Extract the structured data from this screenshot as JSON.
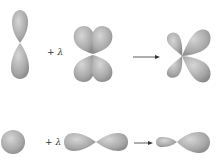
{
  "diagram": {
    "rows": [
      {
        "name": "p-d-hybridization",
        "left_orbital": "p orbital (vertical)",
        "operator_label": "+ λ",
        "right_orbital": "d orbital (cloverleaf)",
        "result": "p-d hybrid orbital"
      },
      {
        "name": "s-p-hybridization",
        "left_orbital": "s orbital (sphere)",
        "operator_label": "+ λ",
        "right_orbital": "p orbital (horizontal)",
        "result": "s-p hybrid orbital"
      }
    ],
    "colors": {
      "lobe_light": "#d0d0d0",
      "lobe_dark": "#8c8c8c",
      "arrow": "#333333",
      "background": "#ffffff"
    }
  }
}
